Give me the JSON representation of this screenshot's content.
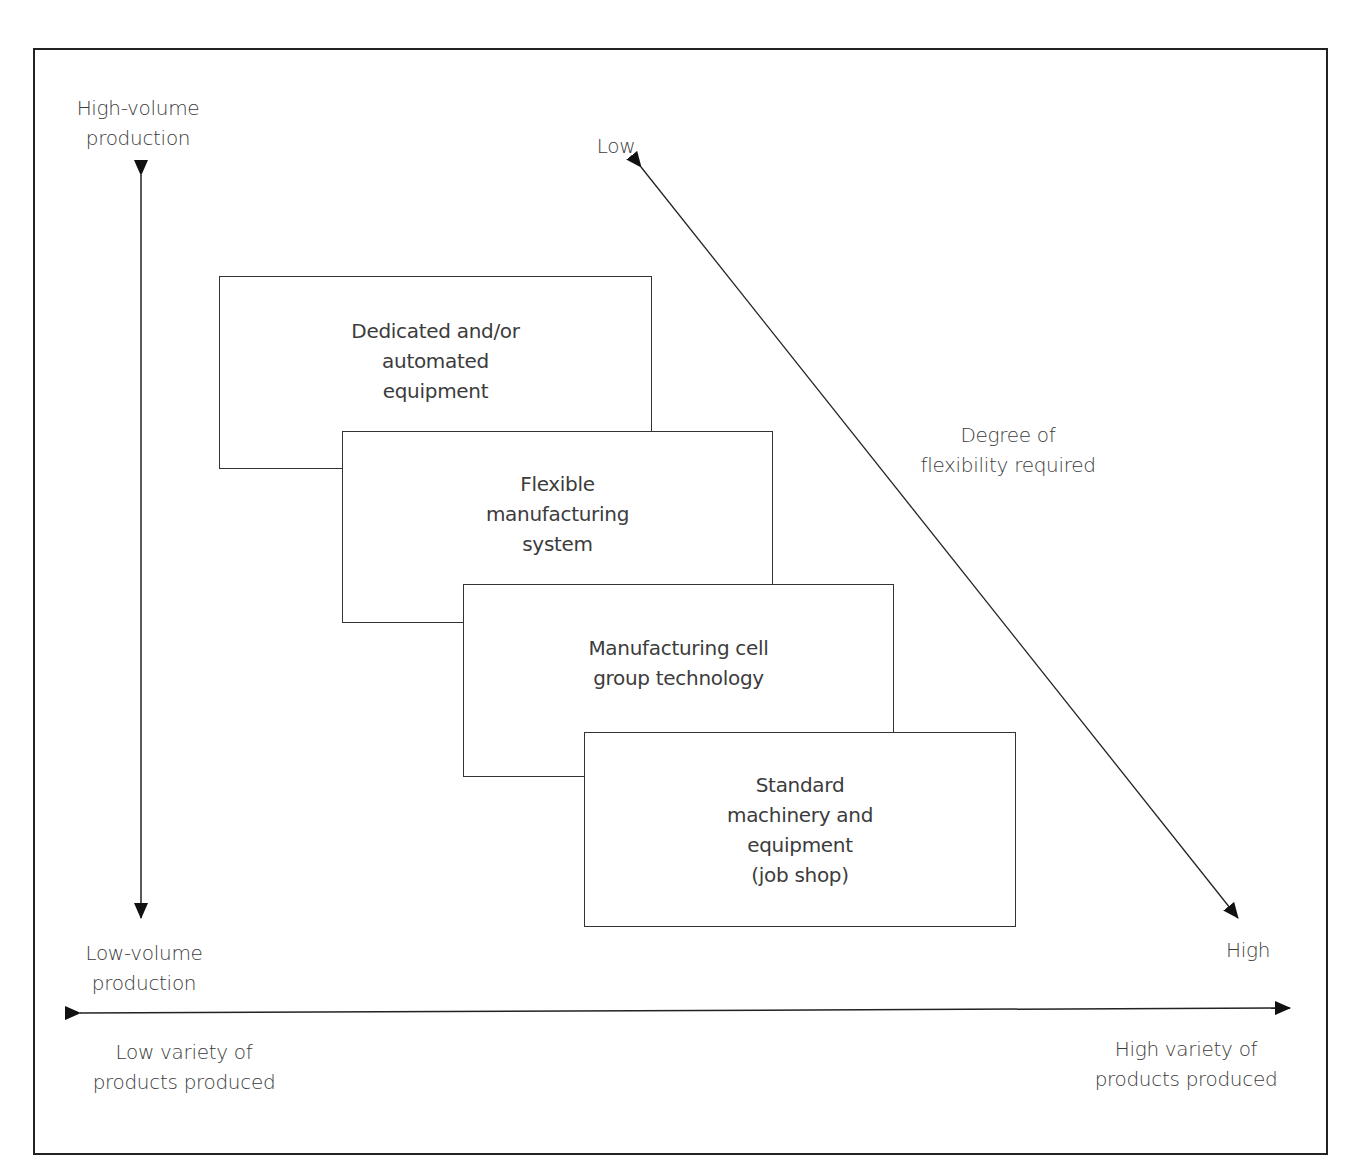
{
  "diagram": {
    "type": "product-process-matrix",
    "vertical_axis": {
      "top_label": "High-volume\nproduction",
      "bottom_label": "Low-volume\nproduction"
    },
    "horizontal_axis": {
      "left_label": "Low variety of\nproducts produced",
      "right_label": "High variety of\nproducts produced"
    },
    "diagonal_axis": {
      "start_label": "Low",
      "end_label": "High",
      "title": "Degree of\nflexibility required"
    },
    "boxes": [
      {
        "label": "Dedicated and/or\nautomated\nequipment"
      },
      {
        "label": "Flexible\nmanufacturing\nsystem"
      },
      {
        "label": "Manufacturing cell\ngroup technology"
      },
      {
        "label": "Standard\nmachinery and\nequipment\n(job shop)"
      }
    ],
    "colors": {
      "line": "#222222",
      "text": "#3c3c3c",
      "background": "#ffffff"
    }
  }
}
